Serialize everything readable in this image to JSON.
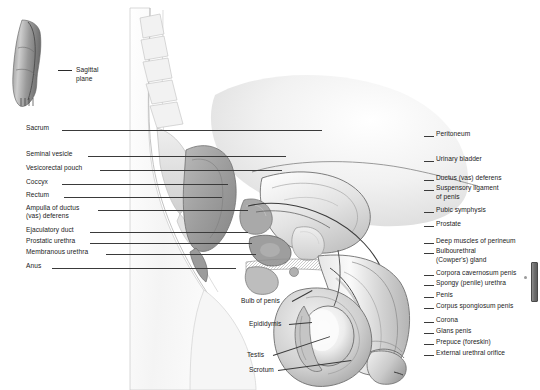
{
  "figure": {
    "background_color": "#ffffff",
    "line_color": "#2a2a2a",
    "text_color": "#1b1b1b",
    "inset_caption_line1": "Sagittal",
    "inset_caption_line2": "plane"
  },
  "labels_left": [
    {
      "text": "Sacrum",
      "x": 26,
      "y": 130,
      "line_x": 62,
      "line_w": 260
    },
    {
      "text": "Seminal vesicle",
      "x": 26,
      "y": 156,
      "line_x": 88,
      "line_w": 198
    },
    {
      "text": "Vesicorectal pouch",
      "x": 26,
      "y": 170,
      "line_x": 100,
      "line_w": 182
    },
    {
      "text": "Coccyx",
      "x": 26,
      "y": 184,
      "line_x": 62,
      "line_w": 166
    },
    {
      "text": "Rectum",
      "x": 26,
      "y": 197,
      "line_x": 64,
      "line_w": 158
    },
    {
      "text": "Ampulla of ductus",
      "x": 26,
      "y": 210,
      "line_x": 98,
      "line_w": 150
    },
    {
      "text": "(vas) deferens",
      "x": 26,
      "y": 218,
      "line_x": 0,
      "line_w": 0
    },
    {
      "text": "Ejaculatory duct",
      "x": 26,
      "y": 232,
      "line_x": 90,
      "line_w": 158
    },
    {
      "text": "Prostatic urethra",
      "x": 26,
      "y": 243,
      "line_x": 90,
      "line_w": 162
    },
    {
      "text": "Membranous urethra",
      "x": 26,
      "y": 254,
      "line_x": 106,
      "line_w": 150
    },
    {
      "text": "Anus",
      "x": 26,
      "y": 268,
      "line_x": 52,
      "line_w": 184
    }
  ],
  "labels_right": [
    {
      "text": "Peritoneum",
      "x": 436,
      "y": 136,
      "line_x": 424,
      "line_w": 10
    },
    {
      "text": "Urinary bladder",
      "x": 436,
      "y": 161,
      "line_x": 424,
      "line_w": 10
    },
    {
      "text": "Ductus (vas) deferens",
      "x": 436,
      "y": 180,
      "line_x": 424,
      "line_w": 10
    },
    {
      "text": "Suspensory ligament",
      "x": 436,
      "y": 190,
      "line_x": 424,
      "line_w": 10
    },
    {
      "text": "of penis",
      "x": 436,
      "y": 199,
      "line_x": 0,
      "line_w": 0
    },
    {
      "text": "Pubic symphysis",
      "x": 436,
      "y": 212,
      "line_x": 424,
      "line_w": 10
    },
    {
      "text": "Prostate",
      "x": 436,
      "y": 226,
      "line_x": 424,
      "line_w": 10
    },
    {
      "text": "Deep muscles of perineum",
      "x": 436,
      "y": 243,
      "line_x": 424,
      "line_w": 10
    },
    {
      "text": "Bulbourethral",
      "x": 436,
      "y": 253,
      "line_x": 424,
      "line_w": 10
    },
    {
      "text": "(Cowper's) gland",
      "x": 436,
      "y": 262,
      "line_x": 0,
      "line_w": 0
    },
    {
      "text": "Corpora cavernosum penis",
      "x": 436,
      "y": 275,
      "line_x": 424,
      "line_w": 10
    },
    {
      "text": "Spongy (penile) urethra",
      "x": 436,
      "y": 285,
      "line_x": 424,
      "line_w": 10
    },
    {
      "text": "Penis",
      "x": 436,
      "y": 297,
      "line_x": 424,
      "line_w": 10
    },
    {
      "text": "Corpus spongiosum penis",
      "x": 436,
      "y": 308,
      "line_x": 424,
      "line_w": 10
    },
    {
      "text": "Corona",
      "x": 436,
      "y": 322,
      "line_x": 424,
      "line_w": 10
    },
    {
      "text": "Glans penis",
      "x": 436,
      "y": 333,
      "line_x": 424,
      "line_w": 10
    },
    {
      "text": "Prepuce (foreskin)",
      "x": 436,
      "y": 344,
      "line_x": 424,
      "line_w": 10
    },
    {
      "text": "External urethral orifice",
      "x": 436,
      "y": 355,
      "line_x": 424,
      "line_w": 10
    }
  ],
  "labels_center": [
    {
      "text": "Bulb of penis",
      "x": 241,
      "y": 303
    },
    {
      "text": "Epididymis",
      "x": 249,
      "y": 326
    },
    {
      "text": "Testis",
      "x": 247,
      "y": 357
    },
    {
      "text": "Scrotum",
      "x": 249,
      "y": 372
    }
  ]
}
